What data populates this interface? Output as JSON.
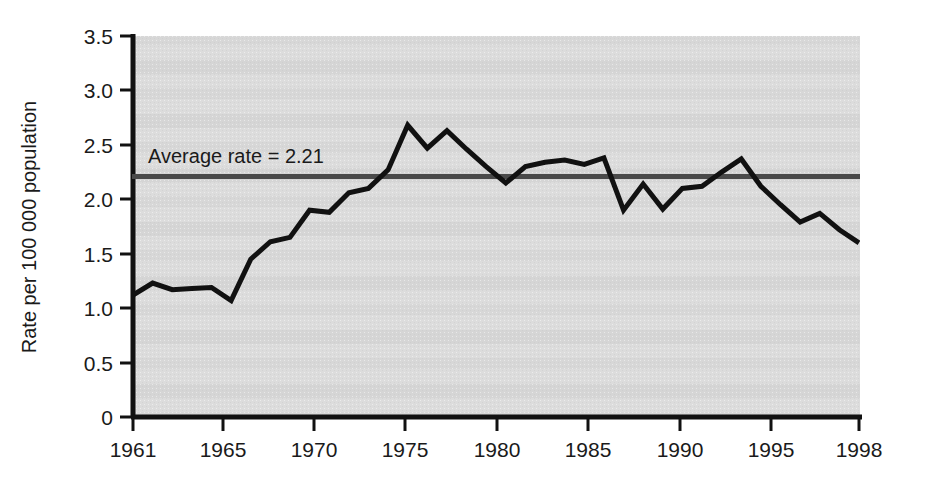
{
  "chart_data": {
    "type": "line",
    "title": "",
    "subtitle": "",
    "xlabel": "",
    "ylabel": "Rate per 100 000 population",
    "xlim": [
      1961,
      1998
    ],
    "ylim": [
      0,
      3.5
    ],
    "grid": false,
    "legend_position": "none",
    "xticks": [
      "1961",
      "1965",
      "1970",
      "1975",
      "1980",
      "1985",
      "1990",
      "1995",
      "1998"
    ],
    "xtick_values": [
      1961,
      1965,
      1970,
      1975,
      1980,
      1985,
      1990,
      1995,
      1998
    ],
    "yticks": [
      "0",
      "0.5",
      "1.0",
      "1.5",
      "2.0",
      "2.5",
      "3.0",
      "3.5"
    ],
    "ytick_values": [
      0,
      0.5,
      1.0,
      1.5,
      2.0,
      2.5,
      3.0,
      3.5
    ],
    "series": [
      {
        "name": "Rate per 100 000 population",
        "color": "#111111",
        "x": [
          1961,
          1962,
          1963,
          1964,
          1965,
          1966,
          1967,
          1968,
          1969,
          1970,
          1971,
          1972,
          1973,
          1974,
          1975,
          1976,
          1977,
          1978,
          1979,
          1980,
          1981,
          1982,
          1983,
          1984,
          1985,
          1986,
          1987,
          1988,
          1989,
          1990,
          1991,
          1992,
          1993,
          1994,
          1995,
          1996,
          1997,
          1998
        ],
        "values": [
          1.12,
          1.23,
          1.17,
          1.18,
          1.19,
          1.07,
          1.45,
          1.61,
          1.65,
          1.9,
          1.88,
          2.06,
          2.1,
          2.27,
          2.68,
          2.47,
          2.63,
          2.46,
          2.3,
          2.15,
          2.3,
          2.34,
          2.36,
          2.32,
          2.38,
          1.9,
          2.14,
          1.91,
          2.1,
          2.12,
          2.25,
          2.37,
          2.12,
          1.95,
          1.79,
          1.87,
          1.72,
          1.6
        ]
      }
    ],
    "annotations": [
      {
        "id": "average-rate",
        "label": "Average rate = 2.21",
        "value": 2.21,
        "type": "horizontal-line",
        "color": "#4a4a4a"
      }
    ],
    "plot_background": "#d9d9d9",
    "axis_color": "#111111"
  },
  "figure": {
    "y_axis_label": "Rate per 100 000 population",
    "average_annotation": "Average rate = 2.21"
  }
}
